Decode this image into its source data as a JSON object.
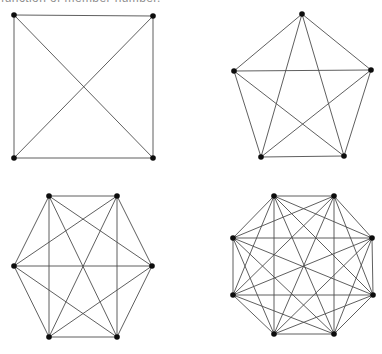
{
  "page": {
    "width": 382,
    "height": 354,
    "background": "#ffffff"
  },
  "caption": {
    "visible_text": "function of member number.",
    "color": "#8f8f8f",
    "note": "text line truncated by top edge of screenshot"
  },
  "style": {
    "edge_color": "#4d4d4d",
    "edge_width": 0.9,
    "node_color": "#0d0d0d",
    "node_radius": 2.8
  },
  "graphs": [
    {
      "id": "k4",
      "label": "complete-graph-4-members",
      "node_count": 4,
      "edge_count": 6,
      "shape": "square",
      "vertices": [
        [
          14,
          15
        ],
        [
          153,
          16
        ],
        [
          153,
          158
        ],
        [
          14,
          158
        ]
      ]
    },
    {
      "id": "k5",
      "label": "complete-graph-5-members",
      "node_count": 5,
      "edge_count": 10,
      "shape": "pentagon",
      "vertices": [
        [
          302,
          14
        ],
        [
          371,
          70
        ],
        [
          344,
          156
        ],
        [
          261,
          157
        ],
        [
          234,
          71
        ]
      ]
    },
    {
      "id": "k6",
      "label": "complete-graph-6-members",
      "node_count": 6,
      "edge_count": 15,
      "shape": "hexagon",
      "vertices": [
        [
          49,
          196
        ],
        [
          117,
          196
        ],
        [
          152,
          266
        ],
        [
          117,
          337
        ],
        [
          49,
          337
        ],
        [
          14,
          266
        ]
      ]
    },
    {
      "id": "k8",
      "label": "complete-graph-8-members",
      "node_count": 8,
      "edge_count": 28,
      "shape": "octagon",
      "vertices": [
        [
          274,
          196
        ],
        [
          334,
          196
        ],
        [
          372,
          238
        ],
        [
          373,
          295
        ],
        [
          334,
          334
        ],
        [
          274,
          334
        ],
        [
          233,
          295
        ],
        [
          233,
          238
        ]
      ]
    }
  ]
}
